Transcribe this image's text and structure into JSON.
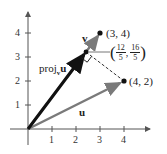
{
  "diagram": {
    "axes": {
      "x_ticks": [
        "1",
        "2",
        "3",
        "4"
      ],
      "y_ticks": [
        "1",
        "2",
        "3",
        "4"
      ],
      "x_range": [
        0,
        4.9
      ],
      "y_range": [
        0,
        4.8
      ]
    },
    "vectors": {
      "v": {
        "label": "v",
        "tip": [
          3,
          4
        ],
        "color": "#7a7a7a"
      },
      "u": {
        "label": "u",
        "tip": [
          4,
          2
        ],
        "color": "#7a7a7a"
      },
      "proj": {
        "label_main": "proj",
        "label_sub": "v",
        "label_tail": "u",
        "tip": [
          2.4,
          3.2
        ],
        "color": "#111111"
      }
    },
    "points": {
      "p34": {
        "label": "(3, 4)"
      },
      "p42": {
        "label": "(4, 2)"
      },
      "proj_point": {
        "x_num": "12",
        "x_den": "5",
        "y_num": "16",
        "y_den": "5",
        "open": "(",
        "sep": ",",
        "close": ")"
      }
    }
  }
}
